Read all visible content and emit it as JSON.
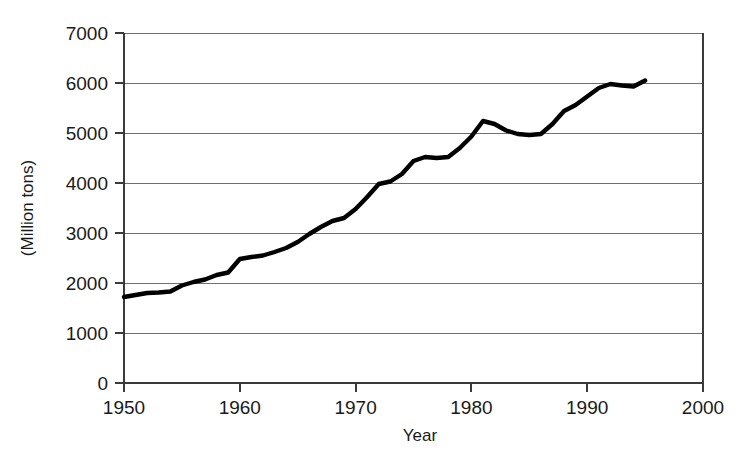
{
  "chart_data": {
    "type": "line",
    "title": "",
    "xlabel": "Year",
    "ylabel": "(Million tons)",
    "xlim": [
      1950,
      2000
    ],
    "ylim": [
      0,
      7000
    ],
    "grid": true,
    "legend": "none",
    "xticks": [
      1950,
      1960,
      1970,
      1980,
      1990,
      2000
    ],
    "xtick_labels": [
      "1950",
      "1960",
      "1970",
      "1980",
      "1990",
      "2000"
    ],
    "yticks": [
      0,
      1000,
      2000,
      3000,
      4000,
      5000,
      6000,
      7000
    ],
    "ytick_labels": [
      "0",
      "1000",
      "2000",
      "3000",
      "4000",
      "5000",
      "6000",
      "7000"
    ],
    "series": [
      {
        "name": "World grain production",
        "color": "#000000",
        "x": [
          1950,
          1951,
          1952,
          1953,
          1954,
          1955,
          1956,
          1957,
          1958,
          1959,
          1960,
          1961,
          1962,
          1963,
          1964,
          1965,
          1966,
          1967,
          1968,
          1969,
          1970,
          1971,
          1972,
          1973,
          1974,
          1975,
          1976,
          1977,
          1978,
          1979,
          1980,
          1981,
          1982,
          1983,
          1984,
          1985,
          1986,
          1987,
          1988,
          1989,
          1990,
          1991,
          1992,
          1993,
          1994,
          1995
        ],
        "values": [
          1720,
          1760,
          1800,
          1810,
          1830,
          1950,
          2020,
          2070,
          2160,
          2210,
          2480,
          2520,
          2550,
          2620,
          2700,
          2820,
          2980,
          3120,
          3240,
          3300,
          3480,
          3720,
          3980,
          4030,
          4180,
          4440,
          4520,
          4500,
          4520,
          4700,
          4930,
          5240,
          5180,
          5050,
          4980,
          4960,
          4980,
          5180,
          5440,
          5560,
          5730,
          5900,
          5980,
          5950,
          5930,
          6050
        ]
      }
    ]
  },
  "axis": {
    "y_title": "(Million tons)",
    "x_title": "Year"
  }
}
